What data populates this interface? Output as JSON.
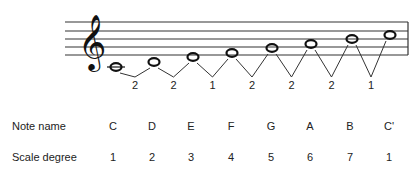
{
  "diagram": {
    "clef": "treble-clef",
    "notes": [
      {
        "name": "C",
        "degree": "1",
        "x": 116,
        "y": 67
      },
      {
        "name": "D",
        "degree": "2",
        "x": 154,
        "y": 62
      },
      {
        "name": "E",
        "degree": "3",
        "x": 193,
        "y": 57
      },
      {
        "name": "F",
        "degree": "4",
        "x": 232,
        "y": 53
      },
      {
        "name": "G",
        "degree": "5",
        "x": 272,
        "y": 48
      },
      {
        "name": "A",
        "degree": "6",
        "x": 311,
        "y": 44
      },
      {
        "name": "B",
        "degree": "7",
        "x": 352,
        "y": 39
      },
      {
        "name": "C'",
        "degree": "1",
        "x": 390,
        "y": 35
      }
    ],
    "intervals": [
      "2",
      "2",
      "1",
      "2",
      "2",
      "2",
      "1"
    ],
    "rows": {
      "note_name_label": "Note name",
      "scale_degree_label": "Scale degree"
    }
  }
}
